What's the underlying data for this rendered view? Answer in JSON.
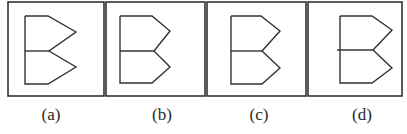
{
  "figure": {
    "stroke_color": "#333333",
    "background": "#ffffff",
    "options": [
      {
        "label": "(a)",
        "box": {
          "x": 8,
          "y": 2,
          "w": 96,
          "h": 94
        },
        "label_x": 51,
        "shape": {
          "outline": [
            [
              25,
              16
            ],
            [
              48,
              16
            ],
            [
              76,
              32
            ],
            [
              49,
              51
            ],
            [
              76,
              67
            ],
            [
              48,
              84
            ],
            [
              25,
              84
            ],
            [
              25,
              16
            ]
          ],
          "divider": [
            [
              25,
              51
            ],
            [
              49,
              51
            ]
          ]
        }
      },
      {
        "label": "(b)",
        "box": {
          "x": 106,
          "y": 2,
          "w": 99,
          "h": 94
        },
        "label_x": 162,
        "shape": {
          "outline": [
            [
              120,
              16
            ],
            [
              152,
              16
            ],
            [
              170,
              31
            ],
            [
              154,
              51
            ],
            [
              170,
              67
            ],
            [
              152,
              83
            ],
            [
              120,
              83
            ],
            [
              120,
              16
            ]
          ],
          "divider": [
            [
              120,
              51
            ],
            [
              154,
              51
            ]
          ]
        }
      },
      {
        "label": "(c)",
        "box": {
          "x": 207,
          "y": 2,
          "w": 99,
          "h": 94
        },
        "label_x": 259,
        "shape": {
          "outline": [
            [
              231,
              16
            ],
            [
              261,
              16
            ],
            [
              280,
              31
            ],
            [
              262,
              51
            ],
            [
              280,
              68
            ],
            [
              262,
              84
            ],
            [
              231,
              84
            ],
            [
              231,
              16
            ]
          ],
          "divider": [
            [
              231,
              51
            ],
            [
              262,
              51
            ]
          ]
        }
      },
      {
        "label": "(d)",
        "box": {
          "x": 308,
          "y": 2,
          "w": 94,
          "h": 94
        },
        "label_x": 362,
        "shape": {
          "outline": [
            [
              340,
              16
            ],
            [
              372,
              16
            ],
            [
              392,
              30
            ],
            [
              373,
              50
            ],
            [
              392,
              68
            ],
            [
              372,
              83
            ],
            [
              340,
              83
            ],
            [
              340,
              16
            ]
          ],
          "divider": [
            [
              337,
              50
            ],
            [
              373,
              50
            ]
          ]
        }
      }
    ],
    "label_y": 120
  }
}
